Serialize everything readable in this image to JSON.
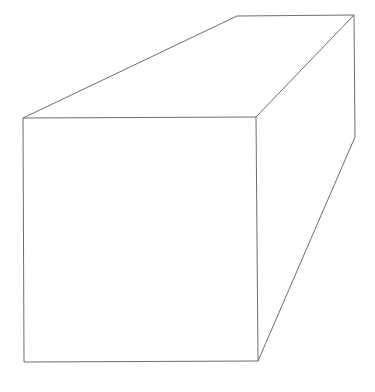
{
  "diagram": {
    "type": "line-drawing",
    "stroke_color": "#6e6e6e",
    "background": "#ffffff",
    "vertices": {
      "front_top_left": [
        23,
        118
      ],
      "front_top_right": [
        256,
        117
      ],
      "front_bottom_right": [
        258,
        361
      ],
      "front_bottom_left": [
        24,
        362
      ],
      "back_top_left": [
        237,
        16
      ],
      "back_top_right": [
        354,
        15
      ],
      "back_bottom_right": [
        355,
        137
      ]
    },
    "faces": [
      "front",
      "top",
      "right-side"
    ]
  }
}
